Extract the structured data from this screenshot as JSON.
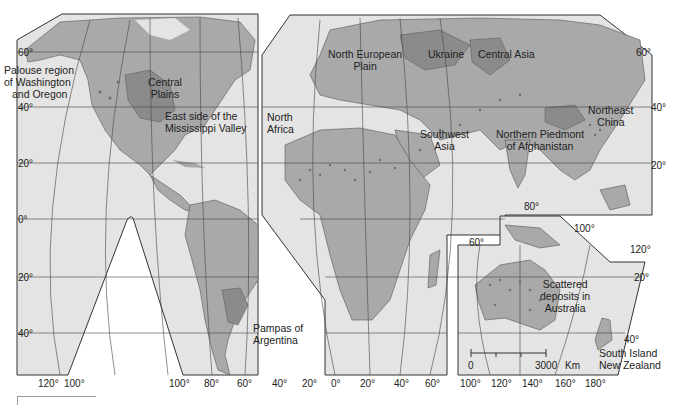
{
  "map": {
    "title": "",
    "colors": {
      "ocean": "#e4e4e4",
      "land": "#a9a9a9",
      "region_highlight": "#8b8b8b",
      "grid": "#444444",
      "border": "#555555",
      "deposit": "#6f6f6f"
    },
    "regions": [
      {
        "id": "palouse",
        "label_line1": "Palouse region",
        "label_line2": "of Washington",
        "label_line3": "and Oregon"
      },
      {
        "id": "central-plains",
        "label_line1": "Central",
        "label_line2": "Plains"
      },
      {
        "id": "mississippi",
        "label_line1": "East side of the",
        "label_line2": "Mississippi Valley"
      },
      {
        "id": "pampas",
        "label_line1": "Pampas of",
        "label_line2": "Argentina"
      },
      {
        "id": "north-european-plain",
        "label_line1": "North European",
        "label_line2": "Plain"
      },
      {
        "id": "ukraine",
        "label_line1": "Ukraine"
      },
      {
        "id": "central-asia",
        "label_line1": "Central Asia"
      },
      {
        "id": "north-africa",
        "label_line1": "North",
        "label_line2": "Africa"
      },
      {
        "id": "southwest-asia",
        "label_line1": "Southwest",
        "label_line2": "Asia"
      },
      {
        "id": "afghanistan",
        "label_line1": "Northern Piedmont",
        "label_line2": "of Afghanistan"
      },
      {
        "id": "northeast-china",
        "label_line1": "Northeast",
        "label_line2": "China"
      },
      {
        "id": "australia",
        "label_line1": "Scattered",
        "label_line2": "deposits in",
        "label_line3": "Australia"
      },
      {
        "id": "new-zealand",
        "label_line1": "South Island",
        "label_line2": "New Zealand"
      }
    ],
    "latitude_labels_left": [
      "60°",
      "40°",
      "20°",
      "0°",
      "20°",
      "40°"
    ],
    "latitude_labels_right": [
      "60°",
      "40°",
      "20°",
      "20°",
      "40°"
    ],
    "longitude_labels_americas": [
      "120°",
      "100°",
      "100°",
      "80°",
      "60°",
      "40°",
      "20°"
    ],
    "longitude_labels_eurafrica": [
      "0°",
      "20°",
      "40°",
      "60°"
    ],
    "longitude_labels_oceania": [
      "100°",
      "120°",
      "140°",
      "160°",
      "180°"
    ],
    "inner_longitude_labels": {
      "lon80": "80°",
      "lon60": "60°",
      "lon100": "100°",
      "lon120": "120°"
    },
    "scale_bar": {
      "start": "0",
      "end": "3000",
      "unit": "Km"
    }
  }
}
